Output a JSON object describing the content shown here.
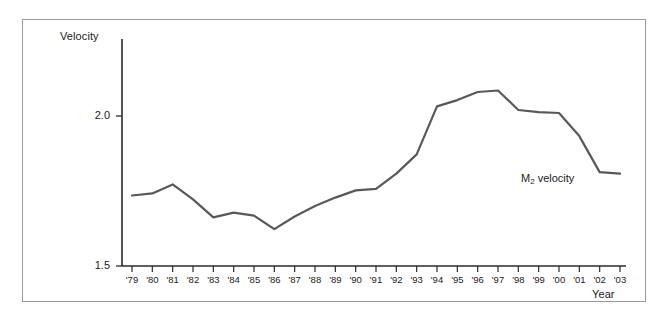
{
  "figure": {
    "background": "#ffffff",
    "frame_border_color": "#9a9a9a"
  },
  "axes": {
    "y_title": "Velocity",
    "x_title": "Year",
    "y_ticks": [
      "1.5",
      "2.0"
    ],
    "x_ticks": [
      "'79",
      "'80",
      "'81",
      "'82",
      "'83",
      "'84",
      "'85",
      "'86",
      "'87",
      "'88",
      "'89",
      "'90",
      "'91",
      "'92",
      "'93",
      "'94",
      "'95",
      "'96",
      "'97",
      "'98",
      "'99",
      "'00",
      "'01",
      "'02",
      "'03"
    ]
  },
  "series_label": {
    "prefix": "M",
    "subscript": "2",
    "suffix": " velocity"
  },
  "chart_data": {
    "type": "line",
    "title": "",
    "subtitle": "",
    "xlabel": "Year",
    "ylabel": "Velocity",
    "ylim": [
      1.5,
      2.0
    ],
    "xlim": [
      "'79",
      "'03"
    ],
    "grid": false,
    "legend": "inline annotation at right of line",
    "line_color": "#595959",
    "line_width": 2.2,
    "categories": [
      "'79",
      "'80",
      "'81",
      "'82",
      "'83",
      "'84",
      "'85",
      "'86",
      "'87",
      "'88",
      "'89",
      "'90",
      "'91",
      "'92",
      "'93",
      "'94",
      "'95",
      "'96",
      "'97",
      "'98",
      "'99",
      "'00",
      "'01",
      "'02",
      "'03"
    ],
    "series": [
      {
        "name": "M2 velocity",
        "values": [
          1.735,
          1.742,
          1.772,
          1.722,
          1.662,
          1.678,
          1.668,
          1.623,
          1.665,
          1.7,
          1.728,
          1.752,
          1.757,
          1.808,
          1.872,
          2.032,
          2.053,
          2.08,
          2.085,
          2.02,
          2.013,
          2.01,
          1.933,
          1.813,
          1.808
        ]
      }
    ],
    "annotations": [
      {
        "text": "M₂ velocity",
        "x": "'01",
        "y": 1.79
      }
    ]
  }
}
